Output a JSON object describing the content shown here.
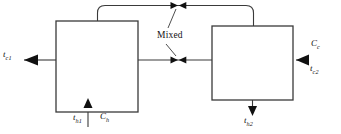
{
  "diagram": {
    "type": "process-flow-diagram",
    "background_color": "#ffffff",
    "line_color": "#3a3a3a",
    "text_color": "#111111",
    "units": [
      {
        "id": "left-exchanger",
        "label": ""
      },
      {
        "id": "right-exchanger",
        "label": ""
      }
    ],
    "labels": {
      "cold_out_left": {
        "base": "t",
        "sub": "c1",
        "text": "tc1"
      },
      "cold_in_right": {
        "base": "t",
        "sub": "c2",
        "text": "tc2"
      },
      "cold_capacity": {
        "base": "C",
        "sub": "c",
        "text": "Cc"
      },
      "hot_in_left": {
        "base": "t",
        "sub": "h1",
        "text": "th1"
      },
      "hot_capacity": {
        "base": "C",
        "sub": "h",
        "text": "Ch"
      },
      "hot_out_right": {
        "base": "t",
        "sub": "h2",
        "text": "th2"
      },
      "mixed_annotation": "Mixed"
    },
    "streams": [
      {
        "name": "cold-outlet-left",
        "direction": "left",
        "arrow": true
      },
      {
        "name": "cold-inlet-right",
        "direction": "left",
        "arrow": true
      },
      {
        "name": "hot-inlet-left",
        "direction": "up",
        "arrow": true
      },
      {
        "name": "hot-outlet-right",
        "direction": "down",
        "arrow": true
      },
      {
        "name": "top-connecting-pipe",
        "direction": "horizontal",
        "arrow": false
      },
      {
        "name": "middle-connecting-pipe",
        "direction": "horizontal",
        "arrow": false
      }
    ],
    "mixing_markers": [
      {
        "name": "mixing-marker-top",
        "x": 178,
        "y": 5
      },
      {
        "name": "mixing-marker-middle",
        "x": 178,
        "y": 60
      }
    ]
  }
}
